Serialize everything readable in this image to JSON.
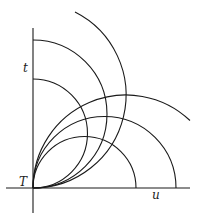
{
  "diagram": {
    "axes": {
      "vertical_label": "t",
      "horizontal_label": "u",
      "origin_label": "T"
    },
    "colors": {
      "stroke": "#1a1a1a",
      "background": "#ffffff"
    },
    "curves": {
      "u_centered_arcs": 3,
      "t_centered_arcs": 3
    }
  }
}
